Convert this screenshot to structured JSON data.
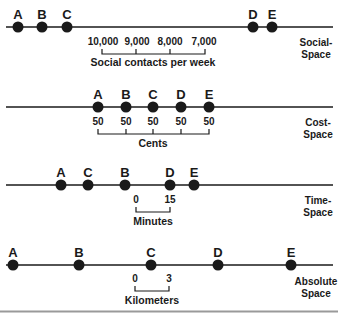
{
  "diagram": {
    "panels": [
      {
        "name": "social-space",
        "side_label_line1": "Social-",
        "side_label_line2": "Space",
        "points": [
          {
            "label": "A",
            "x": 18
          },
          {
            "label": "B",
            "x": 42
          },
          {
            "label": "C",
            "x": 67
          },
          {
            "label": "D",
            "x": 253
          },
          {
            "label": "E",
            "x": 272
          }
        ],
        "scale_ticks": [
          "10,000",
          "9,000",
          "8,000",
          "7,000"
        ],
        "scale_caption": "Social contacts per week"
      },
      {
        "name": "cost-space",
        "side_label_line1": "Cost-",
        "side_label_line2": "Space",
        "points": [
          {
            "label": "A",
            "x": 98
          },
          {
            "label": "B",
            "x": 126
          },
          {
            "label": "C",
            "x": 153
          },
          {
            "label": "D",
            "x": 181
          },
          {
            "label": "E",
            "x": 209
          }
        ],
        "scale_ticks": [
          "50",
          "50",
          "50",
          "50",
          "50"
        ],
        "scale_caption": "Cents"
      },
      {
        "name": "time-space",
        "side_label_line1": "Time-",
        "side_label_line2": "Space",
        "points": [
          {
            "label": "A",
            "x": 61
          },
          {
            "label": "C",
            "x": 88
          },
          {
            "label": "B",
            "x": 125
          },
          {
            "label": "D",
            "x": 170
          },
          {
            "label": "E",
            "x": 194
          }
        ],
        "scale_ticks": [
          "0",
          "15"
        ],
        "scale_caption": "Minutes"
      },
      {
        "name": "absolute-space",
        "side_label_line1": "Absolute",
        "side_label_line2": "Space",
        "points": [
          {
            "label": "A",
            "x": 13
          },
          {
            "label": "B",
            "x": 79
          },
          {
            "label": "C",
            "x": 151
          },
          {
            "label": "D",
            "x": 218
          },
          {
            "label": "E",
            "x": 291
          }
        ],
        "scale_ticks": [
          "0",
          "3"
        ],
        "scale_caption": "Kilometers"
      }
    ],
    "colors": {
      "ink": "#1a1a1a",
      "bottom_rule": "#9a9a9a"
    }
  }
}
